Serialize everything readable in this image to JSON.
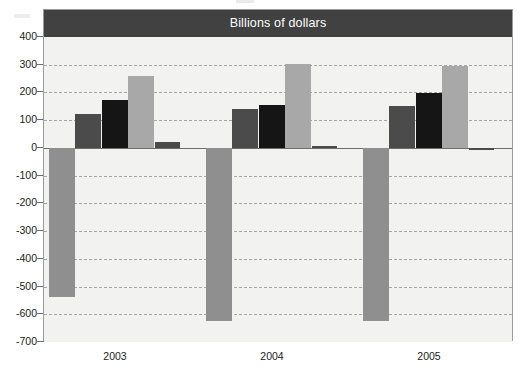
{
  "chart_data": {
    "type": "bar",
    "title": "Billions of dollars",
    "xlabel": "",
    "ylabel": "",
    "categories": [
      "2003",
      "2004",
      "2005"
    ],
    "ylim": [
      -700,
      400
    ],
    "ytick_labels": [
      "400",
      "300",
      "200",
      "100",
      "0",
      "-100",
      "-200",
      "-300",
      "-400",
      "-500",
      "-600",
      "-700"
    ],
    "ytick_values": [
      400,
      300,
      200,
      100,
      0,
      -100,
      -200,
      -300,
      -400,
      -500,
      -600,
      -700
    ],
    "ytick_interval": 100,
    "grid": true,
    "grid_style": "dashed-horizontal",
    "legend": "none",
    "series": [
      {
        "name": "series-1",
        "color": "#8f8f8f",
        "values": [
          -536,
          -623,
          -625
        ]
      },
      {
        "name": "series-2",
        "color": "#4b4b4b",
        "values": [
          123,
          142,
          152
        ]
      },
      {
        "name": "series-3",
        "color": "#151515",
        "values": [
          174,
          153,
          197
        ]
      },
      {
        "name": "series-4",
        "color": "#a8a8a8",
        "values": [
          260,
          302,
          297
        ]
      },
      {
        "name": "series-5",
        "color": "#4b4b4b",
        "values": [
          22,
          7,
          -5
        ]
      }
    ]
  },
  "colors": {
    "title_banner_bg": "#414141",
    "title_text": "#ffffff",
    "plot_bg": "#f2f2f0",
    "frame_border": "#9a9a9a",
    "gridline": "#a6a6a6",
    "zero_line": "#6e6e6e",
    "axis_text": "#1b1b1b",
    "bar_medium_gray": "#8f8f8f",
    "bar_dark_gray": "#4b4b4b",
    "bar_black": "#151515",
    "bar_light_gray": "#a8a8a8"
  },
  "axis": {
    "y_top_label": "400",
    "y_bottom_label": "-700",
    "zero_label": "0"
  }
}
